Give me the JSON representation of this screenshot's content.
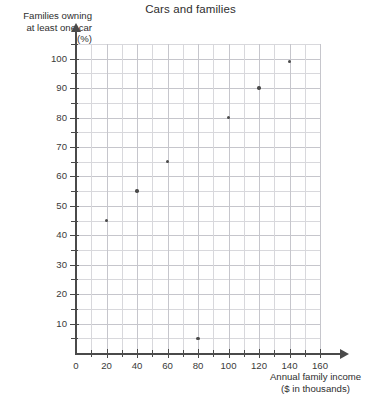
{
  "chart_data": {
    "type": "scatter",
    "title": "Cars and families",
    "xlabel": "Annual family income ($ in thousands)",
    "xlabel_lines": [
      "Annual family income",
      "($ in thousands)"
    ],
    "ylabel": "Families owning at least one car (%)",
    "ylabel_lines": [
      "Families owning",
      "at least one car",
      "(%)"
    ],
    "xlim": [
      0,
      165
    ],
    "ylim": [
      0,
      107
    ],
    "grid": true,
    "legend": "none",
    "x_major_ticks": [
      0,
      20,
      40,
      60,
      80,
      100,
      120,
      140,
      160
    ],
    "x_minor_interval": 10,
    "y_major_ticks": [
      10,
      20,
      30,
      40,
      50,
      60,
      70,
      80,
      90,
      100
    ],
    "y_minor_interval": 5,
    "x_tick_labels": [
      "0",
      "20",
      "40",
      "60",
      "80",
      "100",
      "120",
      "140",
      "160"
    ],
    "y_tick_labels": [
      "10",
      "20",
      "30",
      "40",
      "50",
      "60",
      "70",
      "80",
      "90",
      "100"
    ],
    "points": [
      {
        "x": 20,
        "y": 45
      },
      {
        "x": 40,
        "y": 55
      },
      {
        "x": 60,
        "y": 65
      },
      {
        "x": 80,
        "y": 5
      },
      {
        "x": 100,
        "y": 80
      },
      {
        "x": 120,
        "y": 90
      },
      {
        "x": 140,
        "y": 99
      }
    ],
    "series": [
      {
        "name": "Families owning at least one car",
        "x": [
          20,
          40,
          60,
          80,
          100,
          120,
          140
        ],
        "values": [
          45,
          55,
          65,
          5,
          80,
          90,
          99
        ]
      }
    ],
    "colors": {
      "point": "#4b4b4b",
      "axis": "#4a4a4a",
      "grid_major": "#c6c6cc",
      "grid_minor": "#d8d8dc",
      "text": "#3a3a3a",
      "background": "#ffffff"
    }
  }
}
